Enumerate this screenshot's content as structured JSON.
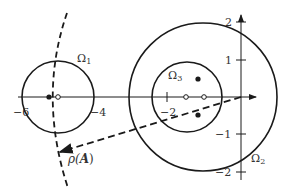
{
  "diagram": {
    "type": "complex-plane-eigenvalue-regions",
    "colors": {
      "stroke": "#1a1a1a",
      "text": "#333333",
      "background": "#ffffff"
    },
    "axes": {
      "x_ticks": [
        {
          "value": -6,
          "label": "−6"
        },
        {
          "value": -4,
          "label": "−4"
        },
        {
          "value": -2,
          "label": "−2"
        }
      ],
      "y_ticks": [
        {
          "value": 2,
          "label": "2"
        },
        {
          "value": 1,
          "label": "1"
        },
        {
          "value": -1,
          "label": "−1"
        },
        {
          "value": -2,
          "label": "−2"
        }
      ]
    },
    "regions": [
      {
        "id": "omega1",
        "label": "Ω",
        "subscript": "1",
        "center": [
          -5,
          0
        ],
        "radius": 1
      },
      {
        "id": "omega2",
        "label": "Ω",
        "subscript": "2",
        "center": [
          -1,
          0
        ],
        "radius": 2
      },
      {
        "id": "omega3",
        "label": "Ω",
        "subscript": "3",
        "center": [
          -1.5,
          0
        ],
        "radius": 0.95
      }
    ],
    "points": {
      "filled": [
        [
          -5.25,
          0
        ],
        [
          -1.15,
          0.5
        ],
        [
          -1.15,
          -0.5
        ]
      ],
      "open": [
        [
          -4.75,
          0
        ],
        [
          -1.5,
          0
        ],
        [
          -1,
          0
        ]
      ]
    },
    "spectral_radius": {
      "label_rho": "ρ(",
      "label_A": "A",
      "label_close": ")"
    }
  }
}
